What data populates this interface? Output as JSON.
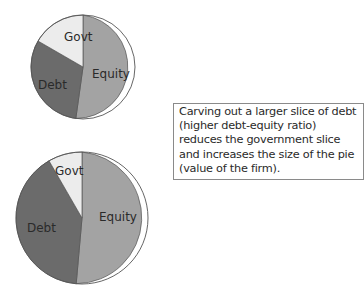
{
  "pies": [
    {
      "id": "before",
      "slices": [
        {
          "label": "Equity",
          "color": "#a3a3a3",
          "start_deg": 0,
          "end_deg": 188
        },
        {
          "label": "Debt",
          "color": "#6b6b6b",
          "start_deg": 188,
          "end_deg": 300
        },
        {
          "label": "Govt",
          "color": "#ececec",
          "start_deg": 300,
          "end_deg": 360
        }
      ]
    },
    {
      "id": "after",
      "slices": [
        {
          "label": "Equity",
          "color": "#a3a3a3",
          "start_deg": 0,
          "end_deg": 185
        },
        {
          "label": "Debt",
          "color": "#6b6b6b",
          "start_deg": 185,
          "end_deg": 330
        },
        {
          "label": "Govt",
          "color": "#ececec",
          "start_deg": 330,
          "end_deg": 360
        }
      ]
    }
  ],
  "labels": {
    "equity": "Equity",
    "debt": "Debt",
    "govt": "Govt"
  },
  "note": {
    "text": "Carving out a larger slice of debt (higher debt-equity ratio) reduces the government slice and increases the size of the pie (value of the firm)."
  }
}
